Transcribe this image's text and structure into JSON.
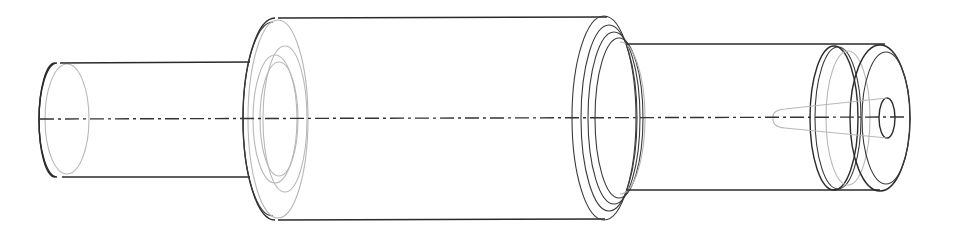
{
  "drawing": {
    "type": "isometric-stepped-shaft-line-drawing",
    "colors": {
      "edge": "#2a2a2a",
      "hidden": "#b8b8b8",
      "background": "#ffffff"
    },
    "centerline": {
      "x1": 40,
      "x2": 905,
      "y": 119
    },
    "segments": [
      {
        "name": "left-shaft",
        "left_cx": 52,
        "right_cx": 250,
        "top_y": 63,
        "bottom_y": 177,
        "rx": 16,
        "inner_ellipses": [
          {
            "cx": 65,
            "ry": 52,
            "rx": 14,
            "style": "hidden"
          }
        ]
      },
      {
        "name": "main-body",
        "left_cx": 270,
        "right_cx": 605,
        "top_y": 18,
        "bottom_y": 220,
        "rx": 30,
        "left_face_ellipses": [
          {
            "cx": 252,
            "rx": 10,
            "ry": 100,
            "style": "edge"
          },
          {
            "cx": 280,
            "rx": 22,
            "ry": 95,
            "style": "hidden"
          },
          {
            "cx": 270,
            "rx": 22,
            "ry": 62,
            "style": "hidden"
          },
          {
            "cx": 278,
            "rx": 18,
            "ry": 55,
            "style": "hidden"
          }
        ],
        "right_face_ellipses": [
          {
            "cx": 595,
            "rx": 30,
            "ry": 101,
            "style": "edge"
          },
          {
            "cx": 600,
            "rx": 28,
            "ry": 93,
            "style": "edge"
          },
          {
            "cx": 607,
            "rx": 26,
            "ry": 86,
            "style": "edge"
          },
          {
            "cx": 612,
            "rx": 24,
            "ry": 80,
            "style": "edge"
          },
          {
            "cx": 630,
            "rx": 18,
            "ry": 78,
            "style": "hidden"
          }
        ]
      },
      {
        "name": "right-shaft",
        "left_cx": 630,
        "right_cx": 885,
        "top_y": 44,
        "bottom_y": 190,
        "collar_ellipses": [
          {
            "cx": 830,
            "rx": 22,
            "ry": 72,
            "style": "edge"
          },
          {
            "cx": 834,
            "rx": 22,
            "ry": 72,
            "style": "edge"
          },
          {
            "cx": 846,
            "rx": 18,
            "ry": 68,
            "style": "hidden"
          },
          {
            "cx": 880,
            "rx": 28,
            "ry": 73,
            "style": "edge"
          },
          {
            "cx": 885,
            "rx": 24,
            "ry": 66,
            "style": "edge"
          },
          {
            "cx": 887,
            "rx": 8,
            "ry": 20,
            "style": "edge"
          }
        ],
        "tapered_bore": {
          "tip_x": 772,
          "end_x": 887,
          "tip_half_height": 8,
          "end_half_height": 20
        }
      }
    ]
  }
}
